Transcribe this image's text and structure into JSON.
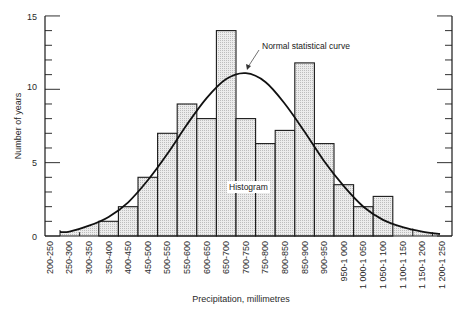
{
  "chart_data": {
    "type": "bar",
    "subtype": "histogram_with_curve",
    "title": "",
    "xlabel": "Precipitation, millimetres",
    "ylabel": "Number of years",
    "ylim": [
      0,
      15
    ],
    "yticks_major": [
      0,
      5,
      10,
      15
    ],
    "yticks_minor_step": 1,
    "grid": false,
    "right_axis_mirror": true,
    "categories": [
      "200-250",
      "250-300",
      "300-350",
      "350-400",
      "400-450",
      "450-500",
      "500-550",
      "550-600",
      "600-650",
      "650-700",
      "700-750",
      "750-800",
      "800-850",
      "850-900",
      "900-950",
      "950-1 000",
      "1 000-1 050",
      "1 050-1 100",
      "1 100-1 150",
      "1 150-1 200",
      "1 200-1 250"
    ],
    "series": [
      {
        "name": "Histogram",
        "type": "bar",
        "values": [
          0,
          0,
          0,
          1,
          2,
          4,
          7,
          9,
          8,
          14,
          8,
          6.3,
          7.2,
          11.8,
          6.3,
          3.5,
          2,
          2.7,
          0,
          0,
          0
        ]
      },
      {
        "name": "Normal statistical curve",
        "type": "line",
        "values": [
          0.1,
          0.3,
          0.7,
          1.3,
          2.3,
          3.8,
          5.6,
          7.6,
          9.4,
          10.7,
          11.1,
          10.5,
          9.0,
          7.1,
          5.1,
          3.4,
          2.0,
          1.1,
          0.6,
          0.3,
          0.1
        ]
      }
    ],
    "annotations": [
      {
        "text": "Normal statistical curve",
        "points_to": "curve peak near 700-750"
      },
      {
        "text": "Histogram",
        "points_to": "bars"
      }
    ],
    "legend": "none (inline annotations)"
  },
  "labels": {
    "ytick_0": "0",
    "ytick_5": "5",
    "ytick_10": "10",
    "ytick_15": "15",
    "curve_annotation": "Normal statistical curve",
    "histogram_annotation": "Histogram"
  },
  "colors": {
    "bar_fill": "#e4e4e4",
    "bar_stroke": "#1a1a1a",
    "curve": "#111111",
    "axis": "#1a1a1a",
    "text": "#2a2a2a"
  }
}
